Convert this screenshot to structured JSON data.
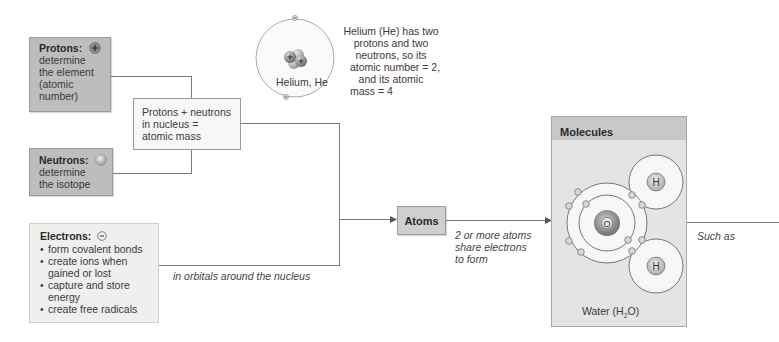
{
  "protons": {
    "title": "Protons:",
    "icon": "plus-particle-icon",
    "lines": [
      "determine",
      "the element",
      "(atomic",
      "number)"
    ]
  },
  "neutrons": {
    "title": "Neutrons:",
    "icon": "neutral-particle-icon",
    "lines": [
      "determine",
      "the isotope"
    ]
  },
  "nucleus_box": {
    "lines": [
      "Protons + neutrons",
      "in nucleus =",
      "atomic mass"
    ]
  },
  "electrons": {
    "title": "Electrons:",
    "icon": "minus-particle-icon",
    "bullets": [
      [
        "form covalent bonds"
      ],
      [
        "create ions when",
        "gained or lost"
      ],
      [
        "capture and store",
        "energy"
      ],
      [
        "create free radicals"
      ]
    ]
  },
  "helium": {
    "label": "Helium, He",
    "caption": [
      "Helium (He) has two",
      "protons and two",
      "neutrons, so its",
      "atomic number = 2,",
      "and its atomic",
      "mass = 4"
    ]
  },
  "connectors": {
    "orbitals_label": "in orbitals around the nucleus",
    "share_label": [
      "2 or more atoms",
      "share electrons",
      "to form"
    ],
    "such_as_label": "Such as"
  },
  "atoms": {
    "label": "Atoms"
  },
  "molecules": {
    "title": "Molecules",
    "example_label_prefix": "Water (H",
    "example_sub": "2",
    "example_label_suffix": "O)",
    "oxygen_symbol": "O",
    "hydrogen_symbol": "H"
  },
  "colors": {
    "dark_box": "#bdbdbd",
    "light_box": "#efefef",
    "molecules_header": "#c8c8c8",
    "molecules_body": "#e4e4e4",
    "line": "#7a7a7a"
  }
}
